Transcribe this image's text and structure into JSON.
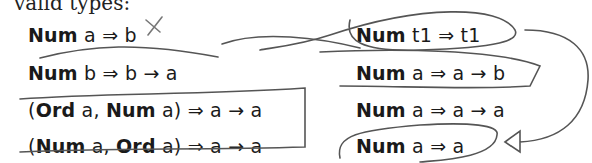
{
  "heading": "valid types:",
  "left_column": [
    {
      "parts": [
        {
          "t": "Num",
          "bold": true
        },
        {
          "t": " a ⇒ b",
          "bold": false
        }
      ]
    },
    {
      "parts": [
        {
          "t": "Num",
          "bold": true
        },
        {
          "t": " b ⇒ b → a",
          "bold": false
        }
      ]
    },
    {
      "parts": [
        {
          "t": "(",
          "bold": false
        },
        {
          "t": "Ord",
          "bold": true
        },
        {
          "t": " a, ",
          "bold": false
        },
        {
          "t": "Num",
          "bold": true
        },
        {
          "t": " a) ⇒ a → a",
          "bold": false
        }
      ]
    },
    {
      "parts": [
        {
          "t": "(",
          "bold": false
        },
        {
          "t": "Num",
          "bold": true
        },
        {
          "t": " a, ",
          "bold": false
        },
        {
          "t": "Ord",
          "bold": true
        },
        {
          "t": " a) ⇒ a → a",
          "bold": false
        }
      ]
    }
  ],
  "right_column": [
    {
      "parts": [
        {
          "t": "Num",
          "bold": true
        },
        {
          "t": " t1 ⇒ t1",
          "bold": false
        }
      ]
    },
    {
      "parts": [
        {
          "t": "Num",
          "bold": true
        },
        {
          "t": " a ⇒ a → b",
          "bold": false
        }
      ]
    },
    {
      "parts": [
        {
          "t": "Num",
          "bold": true
        },
        {
          "t": " a ⇒ a → a",
          "bold": false
        }
      ]
    },
    {
      "parts": [
        {
          "t": "Num",
          "bold": true
        },
        {
          "t": " a ⇒ a",
          "bold": false
        }
      ]
    }
  ],
  "annotations": {
    "pen_color": "#555555",
    "marks": [
      "x-mark-over-b",
      "loop-around-num-t1",
      "arrow-shape-around-num-a-a-b",
      "box-around-ord-num-rows",
      "loop-around-num-a-a",
      "arrow-pointing-to-num-a-a"
    ]
  }
}
